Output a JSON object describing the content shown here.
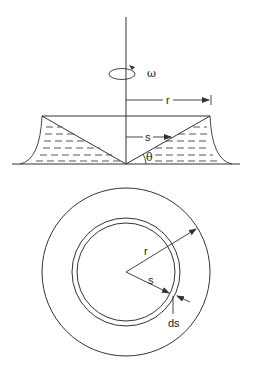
{
  "figure": {
    "top_view": {
      "rotation_label": "ω",
      "radius_label": "r",
      "distance_label": "s",
      "angle_label": "θ"
    },
    "bottom_view": {
      "radius_label": "r",
      "distance_label": "s",
      "width_label": "ds"
    },
    "caption": ""
  },
  "colors": {
    "line": "#333333",
    "background": "#ffffff"
  }
}
